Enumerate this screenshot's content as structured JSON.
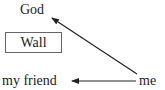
{
  "diagram": {
    "nodes": {
      "god": "God",
      "wall": "Wall",
      "friend": "my friend",
      "me": "me"
    },
    "edges": [
      {
        "from": "me",
        "to": "God"
      },
      {
        "from": "me",
        "to": "my friend"
      }
    ],
    "colors": {
      "text": "#222222",
      "arrow": "#222222",
      "box_border": "#666666",
      "background": "#ffffff"
    }
  }
}
